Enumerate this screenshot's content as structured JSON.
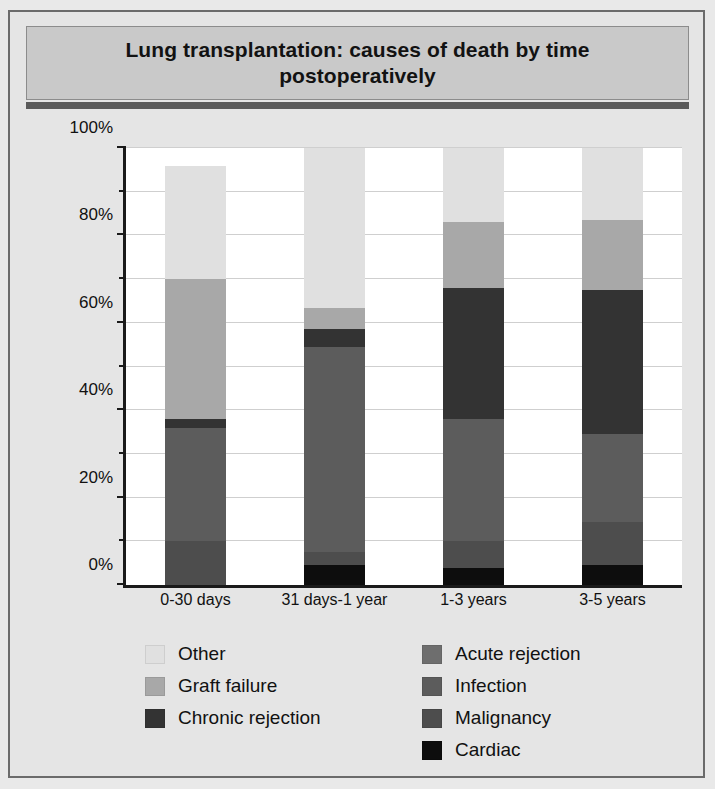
{
  "title": "Lung transplantation: causes of death by time postoperatively",
  "chart_data": {
    "type": "bar",
    "subtype": "stacked-percentage",
    "title": "Lung transplantation: causes of death by time postoperatively",
    "xlabel": "",
    "ylabel": "",
    "categories": [
      "0-30 days",
      "31 days-1 year",
      "1-3 years",
      "3-5 years"
    ],
    "ylim": [
      0,
      100
    ],
    "ytick_labels": [
      "0%",
      "20%",
      "40%",
      "60%",
      "80%",
      "100%"
    ],
    "ytick_values": [
      0,
      20,
      40,
      60,
      80,
      100
    ],
    "yminor_values": [
      10,
      30,
      50,
      70,
      90
    ],
    "grid": true,
    "legend_position": "bottom",
    "stack_order_bottom_up": [
      "Cardiac",
      "Malignancy",
      "Infection",
      "Chronic rejection",
      "Graft failure",
      "Other"
    ],
    "series": [
      {
        "name": "Cardiac",
        "color": "#0d0d0d",
        "values": [
          0,
          4.5,
          4,
          4.5
        ]
      },
      {
        "name": "Malignancy",
        "color": "#4d4d4d",
        "values": [
          10,
          3,
          6,
          10
        ]
      },
      {
        "name": "Infection",
        "color": "#5c5c5c",
        "values": [
          26,
          47,
          28,
          20
        ]
      },
      {
        "name": "Chronic rejection",
        "color": "#333333",
        "values": [
          2,
          4,
          30,
          33
        ]
      },
      {
        "name": "Graft failure",
        "color": "#a8a8a8",
        "values": [
          32,
          5,
          15,
          16
        ]
      },
      {
        "name": "Other",
        "color": "#e0e0e0",
        "values": [
          26,
          36.5,
          17,
          16.5
        ]
      }
    ],
    "cumulative_tops": {
      "0-30 days": [
        0,
        10,
        36,
        38,
        70,
        96
      ],
      "31 days-1 year": [
        4.5,
        7.5,
        54.5,
        58.5,
        63.5,
        100
      ],
      "1-3 years": [
        4,
        10,
        38,
        68,
        83,
        100
      ],
      "3-5 years": [
        4.5,
        14.5,
        34.5,
        67.5,
        83.5,
        100
      ]
    }
  },
  "legend": {
    "left_column": [
      {
        "label": "Other",
        "color": "#e0e0e0"
      },
      {
        "label": "Graft failure",
        "color": "#a8a8a8"
      },
      {
        "label": "Chronic rejection",
        "color": "#333333"
      }
    ],
    "right_column": [
      {
        "label": "Acute rejection",
        "color": "#6e6e6e"
      },
      {
        "label": "Infection",
        "color": "#5c5c5c"
      },
      {
        "label": "Malignancy",
        "color": "#4d4d4d"
      },
      {
        "label": "Cardiac",
        "color": "#0d0d0d"
      }
    ]
  },
  "colors": {
    "figure_background": "#e5e5e5",
    "title_background": "#c9c9c9",
    "title_rule": "#5a5a5a",
    "plot_background": "#ffffff",
    "axis": "#1a1a1a",
    "gridline": "#cfcfcf",
    "border": "#6b6b6b"
  }
}
